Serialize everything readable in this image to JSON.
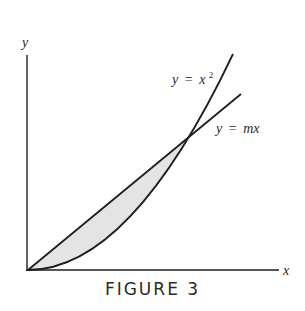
{
  "figure": {
    "caption": "FIGURE 3",
    "axes": {
      "x_label": "x",
      "y_label": "y"
    },
    "curves": [
      {
        "id": "parabola",
        "label_var": "y",
        "label_eq": "=",
        "label_rhs": "x",
        "label_sup": "2",
        "equation": "y = x^2"
      },
      {
        "id": "line",
        "label_var": "y",
        "label_eq": "=",
        "label_rhs": "mx",
        "equation": "y = mx"
      }
    ],
    "shaded_region": {
      "description": "region between y = mx (above) and y = x^2 (below), from origin to their intersection",
      "fill_color": "#e4e4e4"
    },
    "colors": {
      "stroke": "#1e1e1e",
      "text": "#2a2a2a",
      "background": "#ffffff"
    }
  }
}
